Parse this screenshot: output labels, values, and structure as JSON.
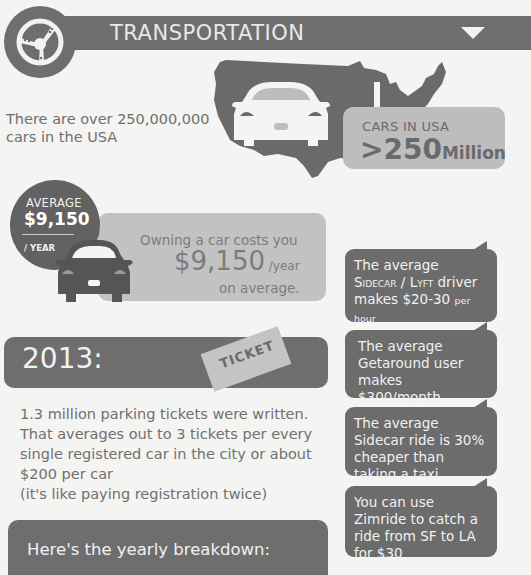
{
  "header": {
    "title": "TRANSPORTATION",
    "badge_icon": "steering-wheel-icon",
    "toggle_icon": "triangle-down-icon"
  },
  "intro": {
    "text": "There are over 250,000,000 cars in the USA"
  },
  "cars_in_usa": {
    "label": "CARS IN USA",
    "value_prefix": ">250",
    "value_suffix": "Million"
  },
  "average_cost": {
    "badge_label": "AVERAGE",
    "badge_value": "$9,150",
    "badge_period": "/ YEAR",
    "line1": "Owning a car costs you",
    "amount": "$9,150",
    "per": " /year",
    "line3": "on average."
  },
  "facts": [
    {
      "line1": "The average",
      "brand1": "Sidecar",
      "sep": " / ",
      "brand2": "Lyft",
      "line2_tail": " driver",
      "line3": "makes $20-30 ",
      "line3_small": "per hour"
    },
    {
      "text": "The average Getaround user makes $300/month"
    },
    {
      "text": "The average Sidecar ride is 30% cheaper than taking a taxi"
    },
    {
      "text": "You can use Zimride to catch a ride from SF to LA for $30"
    }
  ],
  "year_section": {
    "year": "2013:",
    "ticket_label": "TICKET",
    "paragraph_lines": [
      "1.3 million parking tickets were written.",
      "That averages out to 3 tickets per every",
      "single registered car in the city or about",
      "$200 per car",
      "(it's like paying registration twice)"
    ],
    "breakdown_title": "Here's the yearly breakdown:"
  },
  "colors": {
    "dark_gray": "#6e6e6e",
    "light_gray": "#c2c2c2",
    "background": "#f4f4f2",
    "text_gray": "#707070"
  }
}
